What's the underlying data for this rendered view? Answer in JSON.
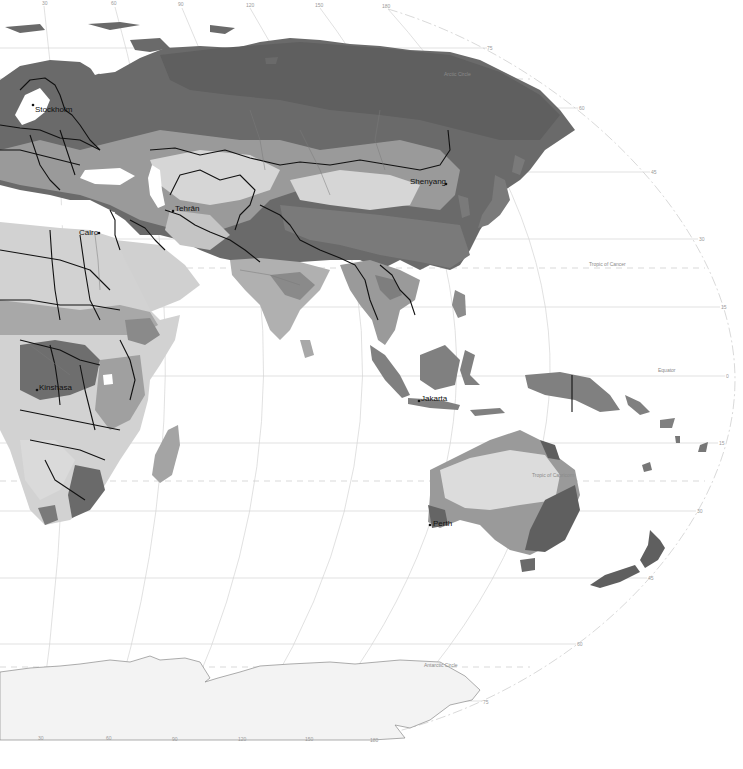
{
  "map": {
    "type": "world climate/vegetation zones (grayscale)",
    "projection": "elliptical world projection (eastern hemisphere view)",
    "top_longitude_ticks": [
      {
        "label": "30",
        "x": 42,
        "y": 4
      },
      {
        "label": "60",
        "x": 113,
        "y": 4
      },
      {
        "label": "90",
        "x": 180,
        "y": 5
      },
      {
        "label": "120",
        "x": 248,
        "y": 6
      },
      {
        "label": "150",
        "x": 318,
        "y": 6
      },
      {
        "label": "180",
        "x": 385,
        "y": 7
      }
    ],
    "bottom_longitude_ticks": [
      {
        "label": "30",
        "x": 40,
        "y": 736
      },
      {
        "label": "60",
        "x": 108,
        "y": 736
      },
      {
        "label": "90",
        "x": 174,
        "y": 737
      },
      {
        "label": "120",
        "x": 241,
        "y": 737
      },
      {
        "label": "150",
        "x": 308,
        "y": 737
      },
      {
        "label": "180",
        "x": 373,
        "y": 738
      }
    ],
    "latitude_labels": [
      {
        "label": "75",
        "x": 487,
        "y": 48
      },
      {
        "label": "60",
        "x": 579,
        "y": 108
      },
      {
        "label": "45",
        "x": 651,
        "y": 173
      },
      {
        "label": "30",
        "x": 699,
        "y": 240
      },
      {
        "label": "15",
        "x": 721,
        "y": 309
      },
      {
        "label": "0",
        "x": 726,
        "y": 377
      },
      {
        "label": "15",
        "x": 719,
        "y": 444
      },
      {
        "label": "30",
        "x": 697,
        "y": 512
      },
      {
        "label": "45",
        "x": 648,
        "y": 579
      },
      {
        "label": "60",
        "x": 577,
        "y": 645
      },
      {
        "label": "75",
        "x": 483,
        "y": 703
      }
    ],
    "special_parallels": [
      {
        "label": "Arctic Circle",
        "x": 444,
        "y": 75
      },
      {
        "label": "Tropic of Cancer",
        "x": 589,
        "y": 265
      },
      {
        "label": "Equator",
        "x": 658,
        "y": 371
      },
      {
        "label": "Tropic of Capricorn",
        "x": 532,
        "y": 476
      },
      {
        "label": "Antarctic Circle",
        "x": 424,
        "y": 666
      }
    ],
    "cities": [
      {
        "name": "Stockholm",
        "x": 34,
        "y": 110,
        "dot_x": 33,
        "dot_y": 105
      },
      {
        "name": "Tehrān",
        "x": 174,
        "y": 211,
        "dot_x": 173,
        "dot_y": 211
      },
      {
        "name": "Cairo",
        "x": 79,
        "y": 233,
        "dot_x": 99,
        "dot_y": 232
      },
      {
        "name": "Shenyang",
        "x": 410,
        "y": 182,
        "dot_x": 446,
        "dot_y": 184
      },
      {
        "name": "Kinshasa",
        "x": 39,
        "y": 387,
        "dot_x": 37,
        "dot_y": 390
      },
      {
        "name": "Jakarta",
        "x": 421,
        "y": 402,
        "dot_x": 419,
        "dot_y": 401
      },
      {
        "name": "Perth",
        "x": 432,
        "y": 525,
        "dot_x": 430,
        "dot_y": 525
      }
    ],
    "shade_colors": {
      "darkest": "#5f5f5f",
      "dark": "#787878",
      "medium": "#969696",
      "light": "#b4b4b4",
      "lighter": "#cdcdcd",
      "lightest": "#e2e2e2",
      "ice": "#f3f3f3",
      "water": "#ffffff"
    }
  }
}
